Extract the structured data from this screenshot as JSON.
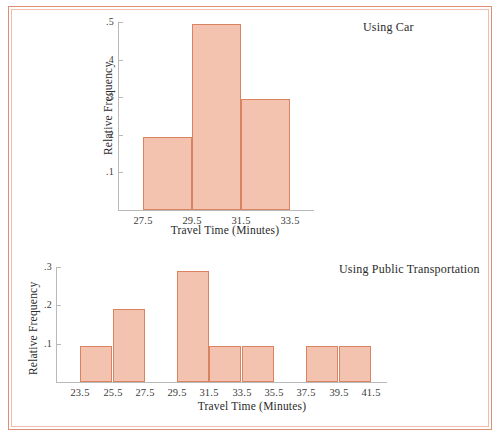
{
  "figure": {
    "background_color": "#ffffff",
    "frame_color_outer": "#e08d73",
    "frame_color_inner": "#f0bcab",
    "bar_fill_color": "#f3c3b0",
    "bar_border_color": "#d98363",
    "axis_color": "#b9b9b9"
  },
  "chart_data": [
    {
      "id": "car",
      "type": "bar",
      "title": "Using Car",
      "xlabel": "Travel Time (Minutes)",
      "ylabel": "Relative Frequency",
      "xlim": [
        26.5,
        34.5
      ],
      "ylim": [
        0,
        0.5
      ],
      "grid": false,
      "xtick_labels": [
        "27.5",
        "29.5",
        "31.5",
        "33.5"
      ],
      "xtick_values": [
        27.5,
        29.5,
        31.5,
        33.5
      ],
      "ytick_labels": [
        ".1",
        ".2",
        ".3",
        ".4",
        ".5"
      ],
      "ytick_values": [
        0.1,
        0.2,
        0.3,
        0.4,
        0.5
      ],
      "bin_width": 2,
      "bins": [
        {
          "left": 27.5,
          "right": 29.5,
          "value": 0.195
        },
        {
          "left": 29.5,
          "right": 31.5,
          "value": 0.495
        },
        {
          "left": 31.5,
          "right": 33.5,
          "value": 0.295
        }
      ]
    },
    {
      "id": "public-transportation",
      "type": "bar",
      "title": "Using Public Transportation",
      "xlabel": "Travel Time (Minutes)",
      "ylabel": "Relative Frequency",
      "xlim": [
        22.0,
        42.5
      ],
      "ylim": [
        0,
        0.3
      ],
      "grid": false,
      "xtick_labels": [
        "23.5",
        "25.5",
        "27.5",
        "29.5",
        "31.5",
        "33.5",
        "35.5",
        "37.5",
        "39.5",
        "41.5"
      ],
      "xtick_values": [
        23.5,
        25.5,
        27.5,
        29.5,
        31.5,
        33.5,
        35.5,
        37.5,
        39.5,
        41.5
      ],
      "ytick_labels": [
        ".1",
        ".2",
        ".3"
      ],
      "ytick_values": [
        0.1,
        0.2,
        0.3
      ],
      "bin_width": 2,
      "bins": [
        {
          "left": 23.5,
          "right": 25.5,
          "value": 0.095
        },
        {
          "left": 25.5,
          "right": 27.5,
          "value": 0.19
        },
        {
          "left": 29.5,
          "right": 31.5,
          "value": 0.29
        },
        {
          "left": 31.5,
          "right": 33.5,
          "value": 0.095
        },
        {
          "left": 33.5,
          "right": 35.5,
          "value": 0.095
        },
        {
          "left": 37.5,
          "right": 39.5,
          "value": 0.095
        },
        {
          "left": 39.5,
          "right": 41.5,
          "value": 0.095
        }
      ]
    }
  ]
}
